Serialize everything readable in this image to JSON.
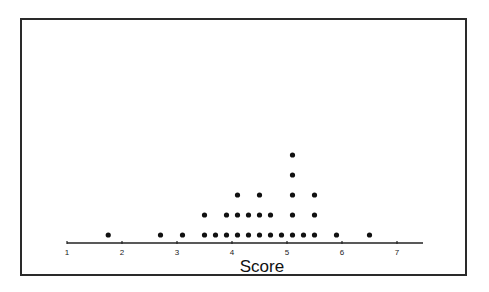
{
  "chart_data": {
    "type": "scatter",
    "subtype": "dot_plot",
    "title": "",
    "xlabel": "Score",
    "ylabel": "",
    "xlim": [
      1,
      7.5
    ],
    "xticks": [
      1,
      2,
      3,
      4,
      5,
      6,
      7
    ],
    "xtick_labels": [
      "1",
      "2",
      "3",
      "4",
      "5",
      "6",
      "7"
    ],
    "grid": false,
    "legend": null,
    "bins": [
      {
        "score": 1.75,
        "count": 1
      },
      {
        "score": 2.7,
        "count": 1
      },
      {
        "score": 3.1,
        "count": 1
      },
      {
        "score": 3.5,
        "count": 2
      },
      {
        "score": 3.7,
        "count": 1
      },
      {
        "score": 3.9,
        "count": 2
      },
      {
        "score": 4.1,
        "count": 3
      },
      {
        "score": 4.3,
        "count": 2
      },
      {
        "score": 4.5,
        "count": 3
      },
      {
        "score": 4.7,
        "count": 2
      },
      {
        "score": 4.9,
        "count": 1
      },
      {
        "score": 5.1,
        "count": 5
      },
      {
        "score": 5.3,
        "count": 1
      },
      {
        "score": 5.5,
        "count": 3
      },
      {
        "score": 5.9,
        "count": 1
      },
      {
        "score": 6.5,
        "count": 1
      }
    ],
    "total_points": 30
  },
  "colors": {
    "dot": "#111111",
    "axis": "#222222",
    "frame": "#2a2a2a"
  }
}
